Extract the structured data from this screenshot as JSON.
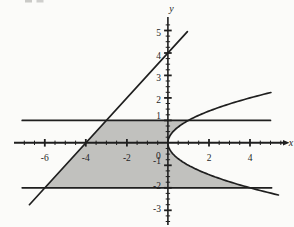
{
  "figure": {
    "paper_color": "#fbfbf9",
    "ink_color": "#1f1f1f",
    "shade_color": "#c1c1be"
  },
  "chart_data": {
    "type": "line",
    "title": "",
    "xlabel": "x",
    "ylabel": "y",
    "xlim": [
      -7.5,
      5.9
    ],
    "ylim": [
      -3.7,
      5.6
    ],
    "grid": false,
    "x_axis": {
      "labeled_ticks": [
        {
          "value": -6,
          "label": "-6"
        },
        {
          "value": -4,
          "label": "-4"
        },
        {
          "value": -2,
          "label": "-2"
        },
        {
          "value": 0,
          "label": "0"
        },
        {
          "value": 2,
          "label": "2"
        },
        {
          "value": 4,
          "label": "4"
        }
      ],
      "major_tick_values": [
        -6,
        -4,
        -2,
        2,
        4
      ],
      "minor_tick_step": 0.5,
      "minor_tick_range": [
        -7,
        5.5
      ],
      "arrow_at_right_end": true
    },
    "y_axis": {
      "labeled_ticks": [
        {
          "value": 5,
          "label": "5"
        },
        {
          "value": 4,
          "label": "4"
        },
        {
          "value": 3,
          "label": "3"
        },
        {
          "value": 2,
          "label": "2"
        },
        {
          "value": 1,
          "label": "1"
        },
        {
          "value": -1,
          "label": "-1"
        },
        {
          "value": -2,
          "label": "-2"
        },
        {
          "value": -3,
          "label": "-3"
        }
      ],
      "major_tick_values": [
        -3,
        -2,
        -1,
        1,
        2,
        3,
        4,
        5
      ],
      "minor_tick_step": 0.25,
      "minor_tick_range": [
        -3.5,
        5.25
      ]
    },
    "curves": [
      {
        "id": "line-y-eq-x-plus-4",
        "equation": "y = x + 4",
        "type": "segment",
        "from": [
          -6.75,
          -2.75
        ],
        "to": [
          0.95,
          4.95
        ]
      },
      {
        "id": "hline-y-eq-1",
        "equation": "y = 1",
        "type": "segment",
        "from": [
          -7.1,
          1
        ],
        "to": [
          5.0,
          1
        ]
      },
      {
        "id": "hline-y-eq-neg-2",
        "equation": "y = -2",
        "type": "segment",
        "from": [
          -7.1,
          -2
        ],
        "to": [
          5.05,
          -2
        ]
      },
      {
        "id": "parabola-x-eq-y-squared",
        "equation": "x = y^2",
        "type": "parabola",
        "y_from": 2.24,
        "y_to": -2.35
      }
    ],
    "shaded_region": {
      "description": "Region bounded on the left by y = x + 4, above by y = 1, on the right by x = y^2, below by y = -2",
      "corner_points": [
        [
          -3,
          1
        ],
        [
          1,
          1
        ],
        [
          4,
          -2
        ],
        [
          -6,
          -2
        ]
      ],
      "right_boundary": {
        "equation": "x = y^2",
        "y_from": 1,
        "y_to": -2
      }
    }
  }
}
